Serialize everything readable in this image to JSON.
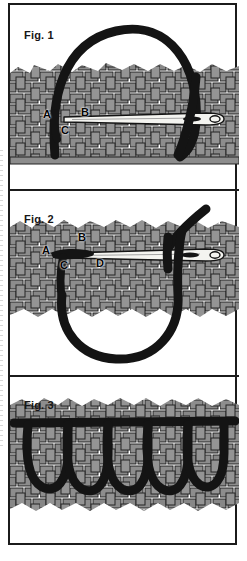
{
  "document": {
    "type": "instructional-diagram",
    "subject": "blanket / buttonhole embroidery stitch on woven fabric",
    "panel_count": 3
  },
  "figures": [
    {
      "id": "fig1",
      "label": "Fig. 1",
      "caption_points": [
        "A",
        "B",
        "C"
      ],
      "elements": {
        "fabric": "plain-woven-fabric",
        "needle": "sewing-needle",
        "thread": "thread-arc-above-fabric"
      }
    },
    {
      "id": "fig2",
      "label": "Fig. 2",
      "caption_points": [
        "A",
        "B",
        "C",
        "D"
      ],
      "elements": {
        "fabric": "plain-woven-fabric",
        "needle": "sewing-needle",
        "thread": "thread-loop-below-fabric"
      }
    },
    {
      "id": "fig3",
      "label": "Fig. 3",
      "caption_points": [],
      "elements": {
        "fabric": "plain-woven-fabric",
        "thread": "completed-row-of-loop-stitches",
        "loop_count": 5
      }
    }
  ],
  "colors": {
    "thread": "#141414",
    "fabric_weave": "#8d8d8d",
    "fabric_weave_dark": "#6f6f6f",
    "fabric_outline": "#232323",
    "needle_body": "#f4f4f0",
    "needle_outline": "#141414",
    "frame": "#1b1b1b",
    "page": "#ffffff",
    "label_text": "#050505"
  }
}
